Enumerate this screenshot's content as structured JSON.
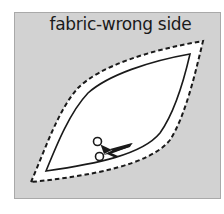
{
  "diagram": {
    "label": "fabric-wrong side",
    "colors": {
      "fabric": "#d2d2d2",
      "fabric_border": "#a9a9a9",
      "seam_allowance": "#ffffff",
      "lines": "#1a1a1a"
    },
    "elements": [
      {
        "type": "cutting-line",
        "style": "dashed",
        "description": "outer cutting line around pattern piece"
      },
      {
        "type": "stitching-line",
        "style": "solid",
        "description": "inner seam line of pattern piece"
      },
      {
        "type": "icon",
        "name": "scissors-icon",
        "description": "scissors indicating cutting along line"
      }
    ]
  }
}
